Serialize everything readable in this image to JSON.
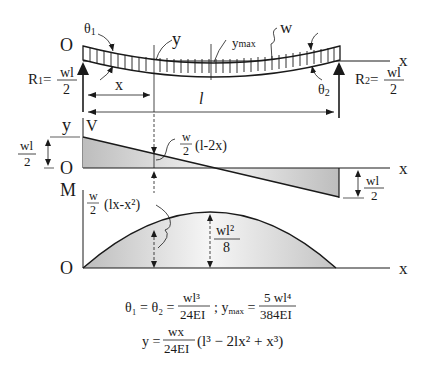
{
  "beam": {
    "origin_label": "O",
    "x_axis_label": "x",
    "theta1_label": "θ",
    "theta1_sub": "1",
    "theta2_label": "θ",
    "theta2_sub": "2",
    "y_label": "y",
    "ymax_label": "y",
    "ymax_sub": "max",
    "load_label": "w",
    "x_dim_label": "x",
    "span_label": "l",
    "r1_lhs": "R",
    "r1_sub": "1",
    "r1_num": "wl",
    "r1_den": "2",
    "r2_lhs": "R",
    "r2_sub": "2",
    "r2_num": "wl",
    "r2_den": "2"
  },
  "shear": {
    "y_axis_label": "y",
    "v_label": "V",
    "origin_label": "O",
    "x_axis_label": "x",
    "left_mag_num": "wl",
    "left_mag_den": "2",
    "right_mag_num": "wl",
    "right_mag_den": "2",
    "formula_num": "w",
    "formula_den": "2",
    "formula_expr": "(l-2x)"
  },
  "moment": {
    "m_label": "M",
    "origin_label": "O",
    "x_axis_label": "x",
    "formula_num": "w",
    "formula_den": "2",
    "formula_expr": "(lx-x²)",
    "max_num": "wl²",
    "max_den": "8"
  },
  "equations": {
    "eq1_lhs": "θ₁ = θ₂ =",
    "eq1_num": "wl³",
    "eq1_den": "24EI",
    "eq1_sep": "; y",
    "eq1_sub": "max",
    "eq1_eq": "=",
    "eq1_num2": "5 wl⁴",
    "eq1_den2": "384EI",
    "eq2_lhs": "y =",
    "eq2_num": "wx",
    "eq2_den": "24EI",
    "eq2_expr": "(l³ − 2lx² + x³)"
  },
  "colors": {
    "line": "#1a1a1a",
    "fill_dark": "#b8b8b8",
    "fill_light": "#f2f2f2"
  }
}
